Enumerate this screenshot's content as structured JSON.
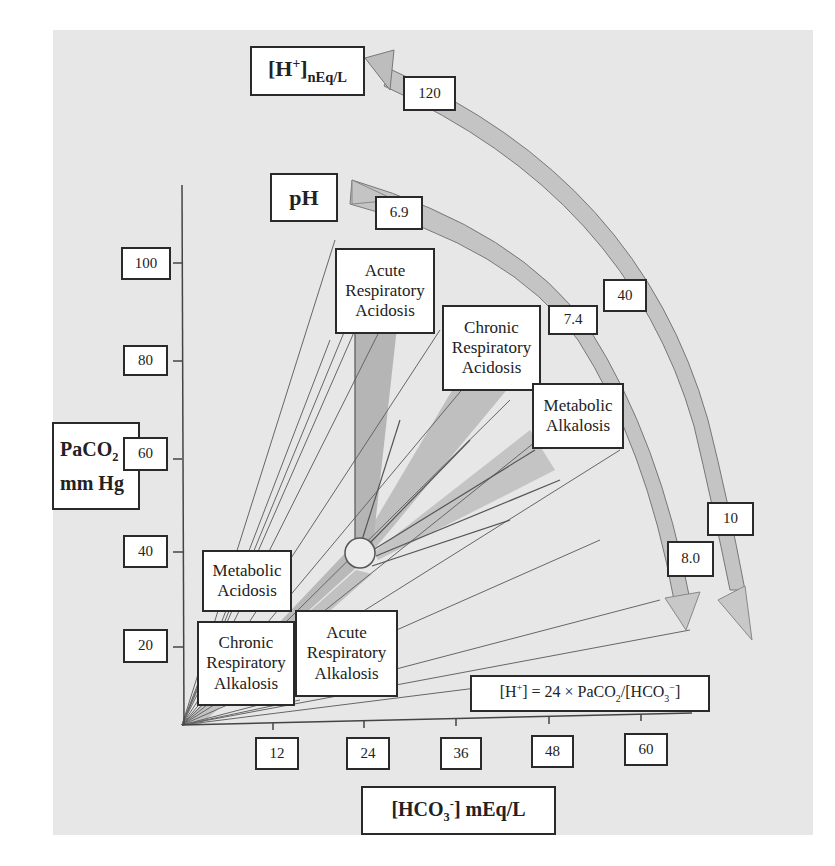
{
  "figure": {
    "y_axis": {
      "label_line1": "PaCO",
      "label_sub": "2",
      "label_line2": "mm Hg",
      "ticks": [
        "100",
        "80",
        "60",
        "40",
        "20"
      ]
    },
    "x_axis": {
      "label_prefix": "[HCO",
      "label_sub": "3",
      "label_sup": "-",
      "label_suffix": "] mEq/L",
      "ticks": [
        "12",
        "24",
        "36",
        "48",
        "60"
      ]
    },
    "h_scale": {
      "label_main": "[H",
      "label_sup": "+",
      "label_close": "]",
      "label_sub": "nEq/L",
      "values": [
        "120",
        "40",
        "10"
      ]
    },
    "ph_scale": {
      "label": "pH",
      "values": [
        "6.9",
        "7.4",
        "8.0"
      ]
    },
    "regions": {
      "acute_resp_acidosis": [
        "Acute",
        "Respiratory",
        "Acidosis"
      ],
      "chronic_resp_acidosis": [
        "Chronic",
        "Respiratory",
        "Acidosis"
      ],
      "metabolic_alkalosis": [
        "Metabolic",
        "Alkalosis"
      ],
      "metabolic_acidosis": [
        "Metabolic",
        "Acidosis"
      ],
      "chronic_resp_alkalosis": [
        "Chronic",
        "Respiratory",
        "Alkalosis"
      ],
      "acute_resp_alkalosis": [
        "Acute",
        "Respiratory",
        "Alkalosis"
      ]
    },
    "equation": {
      "p1": "[H",
      "p1_sup": "+",
      "p2": "] = 24 × PaCO",
      "p2_sub": "2",
      "p3": "/[HCO",
      "p3_sub": "3",
      "p3_sup": "−",
      "p4": "]"
    },
    "colors": {
      "panel_bg": "#e7e7e7",
      "band_fill": "#bdbdbd",
      "band_dark": "#a8a8a8",
      "line": "#555555",
      "box_border": "#2a2a2a"
    }
  }
}
